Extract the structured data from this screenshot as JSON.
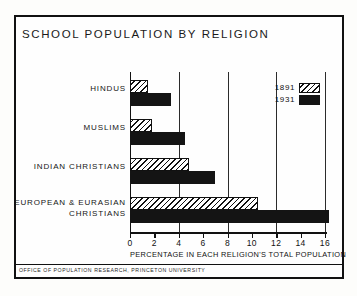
{
  "plate": {
    "title": "SCHOOL POPULATION BY RELIGION",
    "footer": "OFFICE OF POPULATION RESEARCH, PRINCETON UNIVERSITY"
  },
  "legend": {
    "entries": [
      {
        "label": "1891",
        "swatch": "hatched"
      },
      {
        "label": "1931",
        "swatch": "solid-black"
      }
    ]
  },
  "axis": {
    "tick_labels": [
      "0",
      "2",
      "4",
      "6",
      "8",
      "10",
      "12",
      "14",
      "16"
    ],
    "title": "PERCENTAGE IN EACH RELIGION'S TOTAL POPULATION"
  },
  "categories": [
    {
      "line1": "HINDUS",
      "line2": ""
    },
    {
      "line1": "MUSLIMS",
      "line2": ""
    },
    {
      "line1": "INDIAN CHRISTIANS",
      "line2": ""
    },
    {
      "line1": "EUROPEAN & EURASIAN",
      "line2": "CHRISTIANS"
    }
  ],
  "chart_data": {
    "type": "bar",
    "orientation": "horizontal",
    "title": "SCHOOL POPULATION BY RELIGION",
    "xlabel": "PERCENTAGE IN EACH RELIGION'S TOTAL POPULATION",
    "ylabel": "",
    "xlim": [
      0,
      16.8
    ],
    "xticks": [
      0,
      2,
      4,
      6,
      8,
      10,
      12,
      14,
      16
    ],
    "gridlines": [
      4,
      8,
      12,
      16
    ],
    "grid": true,
    "legend_position": "upper-right",
    "categories": [
      "HINDUS",
      "MUSLIMS",
      "INDIAN CHRISTIANS",
      "EUROPEAN & EURASIAN CHRISTIANS"
    ],
    "series": [
      {
        "name": "1891",
        "fill": "hatched",
        "values": [
          1.5,
          1.8,
          4.8,
          10.5
        ]
      },
      {
        "name": "1931",
        "fill": "solid-black",
        "values": [
          3.4,
          4.5,
          7.0,
          16.3
        ]
      }
    ]
  }
}
